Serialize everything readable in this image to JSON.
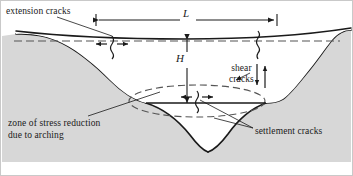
{
  "figure": {
    "domain": "diagram",
    "width": 353,
    "height": 176,
    "colors": {
      "background": "#ffffff",
      "soil_fill": "#d7d7d7",
      "cavity_fill": "#ffffff",
      "line": "#1a1a1a",
      "dashed_line": "#555555",
      "frame": "#c9c9c9",
      "text": "#1a1a1a"
    },
    "labels": {
      "extension_cracks": "extension cracks",
      "shear_cracks": "shear\ncracks",
      "settlement_cracks": "settlement cracks",
      "zone_of_stress": "zone of stress reduction\ndue to arching",
      "dimension_L": "L",
      "dimension_H": "H"
    },
    "dimensions": [
      {
        "name": "L",
        "symbol": "L",
        "orientation": "horizontal",
        "x1": 96,
        "x2": 277,
        "y": 20,
        "meaning": "width of subsidence trough at ground surface"
      },
      {
        "name": "H",
        "symbol": "H",
        "orientation": "vertical",
        "x": 187,
        "y1": 40,
        "y2": 104,
        "meaning": "depth from ground surface to arching zone"
      }
    ],
    "crack_symbols": [
      {
        "name": "extension-crack-surface-left",
        "type": "tension",
        "x": 112,
        "y": 44,
        "arrows": "outward-horizontal"
      },
      {
        "name": "extension-crack-surface-right",
        "type": "vertical-fissure",
        "x": 258,
        "y": 40,
        "arrows": "none"
      },
      {
        "name": "settlement-crack-center",
        "type": "tension",
        "x": 197,
        "y": 98,
        "arrows": "outward-horizontal"
      },
      {
        "name": "shear-crack-right",
        "type": "shear",
        "x": 262,
        "y": 78,
        "arrows": "opposed-vertical"
      }
    ],
    "zones": [
      {
        "name": "soil-mass",
        "fill": "#d7d7d7"
      },
      {
        "name": "arching-zone-ellipse",
        "style": "dashed-ellipse",
        "cx": 197,
        "cy": 101,
        "rx": 68,
        "ry": 16
      },
      {
        "name": "surface-subsidence-dashed",
        "style": "dashed-line"
      }
    ]
  }
}
